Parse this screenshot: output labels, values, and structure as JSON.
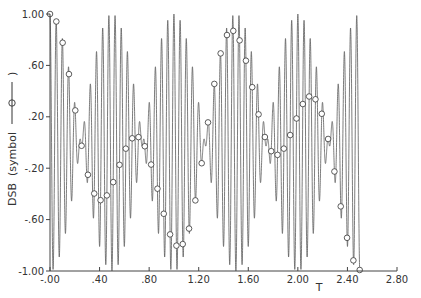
{
  "chart_data": {
    "type": "line",
    "title": "",
    "xlabel": "T",
    "ylabel": "DSB  (symbol ——⊖——)",
    "ylabel_parts": {
      "name": "DSB",
      "symbol_text": "(symbol",
      "symbol_close": ")"
    },
    "xlim": [
      0.0,
      2.8
    ],
    "ylim": [
      -1.0,
      1.0
    ],
    "x_ticks": [
      0.0,
      0.4,
      0.8,
      1.2,
      1.6,
      2.0,
      2.4,
      2.8
    ],
    "x_tick_labels": [
      "-.00",
      ".40",
      ".80",
      "1.20",
      "1.60",
      "2.00",
      "2.40",
      "2.80"
    ],
    "y_ticks": [
      1.0,
      0.6,
      0.2,
      -0.2,
      -0.6,
      -1.0
    ],
    "y_tick_labels": [
      "1.00",
      ".60",
      ".20",
      "-.20",
      "-.60",
      "-1.00"
    ],
    "grid": false,
    "legend": "none",
    "series": [
      {
        "name": "DSB",
        "description": "Double-sideband modulated signal: carrier multiplied by cosine envelope; envelope nodes near T = 0, 0.5, 1.0, 1.5, 2.0, 2.5",
        "formula": "cos(2*pi*fc*T) * cos(2*pi*fm*T)",
        "fc": 20,
        "fm": 1,
        "t_range": [
          0.0,
          2.5
        ],
        "marker": "circle",
        "marker_spacing_T": 0.051,
        "color": "#555555"
      }
    ],
    "envelope_peaks_T": [
      0.25,
      0.75,
      1.25,
      1.75,
      2.25
    ],
    "envelope_nodes_T": [
      0.0,
      0.5,
      1.0,
      1.5,
      2.0,
      2.5
    ]
  },
  "colors": {
    "line": "#5a5a5a",
    "axis": "#444444",
    "marker": "#333333",
    "background": "#ffffff"
  }
}
